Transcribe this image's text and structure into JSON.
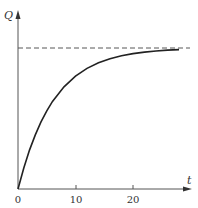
{
  "chart_data": {
    "type": "line",
    "title": "",
    "xlabel": "t",
    "ylabel": "Q",
    "xlim": [
      0,
      27
    ],
    "ylim": [
      0,
      1.1
    ],
    "x_ticks": [
      "0",
      "10",
      "20"
    ],
    "y_ticks": [],
    "grid": false,
    "legend": null,
    "series": [
      {
        "name": "Q(t)",
        "style": "solid",
        "x": [
          0,
          1,
          2,
          3,
          4,
          5,
          6,
          8,
          10,
          12,
          14,
          16,
          18,
          20,
          22,
          24,
          26,
          28
        ],
        "y": [
          0,
          0.149,
          0.276,
          0.384,
          0.476,
          0.554,
          0.621,
          0.725,
          0.8,
          0.855,
          0.895,
          0.924,
          0.945,
          0.96,
          0.971,
          0.979,
          0.985,
          0.989
        ]
      },
      {
        "name": "asymptote",
        "style": "dashed",
        "x": [
          0,
          28
        ],
        "y": [
          1,
          1
        ]
      }
    ],
    "annotations": [
      "Horizontal dashed asymptote at Q = Q_max"
    ]
  },
  "axes": {
    "x_label": "t",
    "y_label": "Q",
    "tick_labels": [
      "0",
      "10",
      "20"
    ]
  }
}
